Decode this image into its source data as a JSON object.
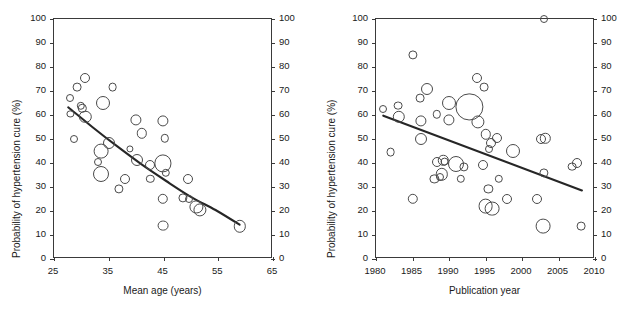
{
  "figure": {
    "caption_fragment": ""
  },
  "chart_data": [
    {
      "type": "scatter",
      "panel": "left",
      "title": "",
      "xlabel": "Mean age (years)",
      "ylabel": "Probability of hypertension cure (%)",
      "xlim": [
        25,
        65
      ],
      "ylim": [
        0,
        100
      ],
      "xticks": [
        "25",
        "35",
        "45",
        "55",
        "65"
      ],
      "xtick_values": [
        25,
        35,
        45,
        55,
        65
      ],
      "yticks": [
        "0",
        "10",
        "20",
        "30",
        "40",
        "50",
        "60",
        "70",
        "80",
        "90",
        "100"
      ],
      "ytick_values": [
        0,
        10,
        20,
        30,
        40,
        50,
        60,
        70,
        80,
        90,
        100
      ],
      "grid": false,
      "legend": "none",
      "marker": "open-circle",
      "size_encodes": "study weight",
      "points": [
        {
          "x": 28.0,
          "y": 67.0,
          "s": 4.0
        },
        {
          "x": 28.0,
          "y": 60.5,
          "s": 3.6
        },
        {
          "x": 28.6,
          "y": 50.0,
          "s": 4.0
        },
        {
          "x": 29.2,
          "y": 71.7,
          "s": 4.4
        },
        {
          "x": 30.6,
          "y": 75.3,
          "s": 5.0
        },
        {
          "x": 29.9,
          "y": 63.8,
          "s": 4.2
        },
        {
          "x": 30.2,
          "y": 62.8,
          "s": 4.2
        },
        {
          "x": 30.7,
          "y": 59.3,
          "s": 6.2
        },
        {
          "x": 33.1,
          "y": 40.3,
          "s": 4.0
        },
        {
          "x": 33.6,
          "y": 45.0,
          "s": 7.4
        },
        {
          "x": 33.6,
          "y": 35.3,
          "s": 8.0
        },
        {
          "x": 34.0,
          "y": 65.0,
          "s": 7.0
        },
        {
          "x": 35.0,
          "y": 48.2,
          "s": 6.0
        },
        {
          "x": 35.7,
          "y": 71.5,
          "s": 4.4
        },
        {
          "x": 36.9,
          "y": 29.2,
          "s": 4.6
        },
        {
          "x": 38.0,
          "y": 33.5,
          "s": 5.0
        },
        {
          "x": 38.8,
          "y": 46.0,
          "s": 3.6
        },
        {
          "x": 39.9,
          "y": 58.0,
          "s": 5.6
        },
        {
          "x": 40.1,
          "y": 41.2,
          "s": 6.0
        },
        {
          "x": 41.0,
          "y": 52.3,
          "s": 5.2
        },
        {
          "x": 42.6,
          "y": 39.3,
          "s": 5.0
        },
        {
          "x": 42.6,
          "y": 33.5,
          "s": 4.2
        },
        {
          "x": 44.9,
          "y": 57.7,
          "s": 5.6
        },
        {
          "x": 45.2,
          "y": 50.3,
          "s": 4.2
        },
        {
          "x": 44.9,
          "y": 39.8,
          "s": 8.6
        },
        {
          "x": 45.4,
          "y": 35.8,
          "s": 4.2
        },
        {
          "x": 44.9,
          "y": 25.0,
          "s": 5.2
        },
        {
          "x": 44.9,
          "y": 13.9,
          "s": 5.4
        },
        {
          "x": 48.6,
          "y": 25.5,
          "s": 4.6
        },
        {
          "x": 49.5,
          "y": 33.5,
          "s": 5.0
        },
        {
          "x": 49.6,
          "y": 25.0,
          "s": 4.0
        },
        {
          "x": 51.0,
          "y": 21.8,
          "s": 6.6
        },
        {
          "x": 51.7,
          "y": 20.6,
          "s": 6.6
        },
        {
          "x": 58.9,
          "y": 13.7,
          "s": 6.2
        }
      ],
      "trend": {
        "kind": "curve",
        "points": [
          {
            "x": 27.6,
            "y": 63.2
          },
          {
            "x": 32.0,
            "y": 55.0
          },
          {
            "x": 36.5,
            "y": 47.0
          },
          {
            "x": 41.0,
            "y": 39.4
          },
          {
            "x": 45.5,
            "y": 32.5
          },
          {
            "x": 50.0,
            "y": 25.9
          },
          {
            "x": 54.5,
            "y": 20.4
          },
          {
            "x": 58.9,
            "y": 14.3
          }
        ]
      }
    },
    {
      "type": "scatter",
      "panel": "right",
      "title": "",
      "xlabel": "Publication year",
      "ylabel": "Probability of hypertension cure (%)",
      "xlim": [
        1980,
        2010
      ],
      "ylim": [
        0,
        100
      ],
      "xticks": [
        "1980",
        "1985",
        "1990",
        "1995",
        "2000",
        "2005",
        "2010"
      ],
      "xtick_values": [
        1980,
        1985,
        1990,
        1995,
        2000,
        2005,
        2010
      ],
      "yticks": [
        "0",
        "10",
        "20",
        "30",
        "40",
        "50",
        "60",
        "70",
        "80",
        "90",
        "100"
      ],
      "ytick_values": [
        0,
        10,
        20,
        30,
        40,
        50,
        60,
        70,
        80,
        90,
        100
      ],
      "grid": false,
      "legend": "none",
      "marker": "open-circle",
      "size_encodes": "study weight",
      "points": [
        {
          "x": 1980.9,
          "y": 62.6,
          "s": 4.0
        },
        {
          "x": 1982.0,
          "y": 44.7,
          "s": 4.4
        },
        {
          "x": 1983.0,
          "y": 63.9,
          "s": 4.4
        },
        {
          "x": 1983.1,
          "y": 59.3,
          "s": 6.2
        },
        {
          "x": 1985.0,
          "y": 84.9,
          "s": 4.6
        },
        {
          "x": 1985.0,
          "y": 25.0,
          "s": 5.2
        },
        {
          "x": 1986.0,
          "y": 67.0,
          "s": 4.4
        },
        {
          "x": 1986.2,
          "y": 57.7,
          "s": 5.6
        },
        {
          "x": 1986.1,
          "y": 50.0,
          "s": 6.0
        },
        {
          "x": 1987.0,
          "y": 71.0,
          "s": 6.0
        },
        {
          "x": 1988.0,
          "y": 33.5,
          "s": 4.6
        },
        {
          "x": 1988.3,
          "y": 60.3,
          "s": 4.2
        },
        {
          "x": 1988.4,
          "y": 40.3,
          "s": 5.0
        },
        {
          "x": 1989.0,
          "y": 35.3,
          "s": 6.2
        },
        {
          "x": 1988.8,
          "y": 34.0,
          "s": 4.0
        },
        {
          "x": 1989.2,
          "y": 41.2,
          "s": 5.2
        },
        {
          "x": 1989.4,
          "y": 40.6,
          "s": 4.4
        },
        {
          "x": 1990.0,
          "y": 65.0,
          "s": 7.0
        },
        {
          "x": 1990.0,
          "y": 58.0,
          "s": 5.6
        },
        {
          "x": 1991.0,
          "y": 39.5,
          "s": 8.0
        },
        {
          "x": 1991.6,
          "y": 33.5,
          "s": 4.2
        },
        {
          "x": 1992.0,
          "y": 38.5,
          "s": 4.6
        },
        {
          "x": 1992.8,
          "y": 63.5,
          "s": 13.6
        },
        {
          "x": 1993.9,
          "y": 75.3,
          "s": 5.0
        },
        {
          "x": 1994.0,
          "y": 57.0,
          "s": 6.6
        },
        {
          "x": 1994.8,
          "y": 71.5,
          "s": 4.4
        },
        {
          "x": 1994.6,
          "y": 39.3,
          "s": 5.0
        },
        {
          "x": 1995.0,
          "y": 52.0,
          "s": 5.2
        },
        {
          "x": 1995.4,
          "y": 29.2,
          "s": 4.6
        },
        {
          "x": 1995.0,
          "y": 22.0,
          "s": 7.4
        },
        {
          "x": 1995.9,
          "y": 21.0,
          "s": 7.4
        },
        {
          "x": 1995.8,
          "y": 48.2,
          "s": 5.0
        },
        {
          "x": 1995.5,
          "y": 46.0,
          "s": 4.0
        },
        {
          "x": 1996.6,
          "y": 50.3,
          "s": 5.0
        },
        {
          "x": 1996.8,
          "y": 33.5,
          "s": 4.2
        },
        {
          "x": 1997.9,
          "y": 25.0,
          "s": 5.0
        },
        {
          "x": 1998.8,
          "y": 44.8,
          "s": 7.0
        },
        {
          "x": 2002.0,
          "y": 25.0,
          "s": 5.0
        },
        {
          "x": 2002.6,
          "y": 50.0,
          "s": 5.0
        },
        {
          "x": 2003.0,
          "y": 100.2,
          "s": 4.0
        },
        {
          "x": 2003.2,
          "y": 50.3,
          "s": 5.2
        },
        {
          "x": 2003.0,
          "y": 35.8,
          "s": 4.6
        },
        {
          "x": 2002.9,
          "y": 13.7,
          "s": 7.4
        },
        {
          "x": 2006.9,
          "y": 38.5,
          "s": 4.4
        },
        {
          "x": 2007.6,
          "y": 40.0,
          "s": 5.0
        },
        {
          "x": 2008.1,
          "y": 13.7,
          "s": 4.4
        }
      ],
      "trend": {
        "kind": "line",
        "points": [
          {
            "x": 1981.0,
            "y": 59.7
          },
          {
            "x": 2008.2,
            "y": 28.6
          }
        ]
      }
    }
  ]
}
